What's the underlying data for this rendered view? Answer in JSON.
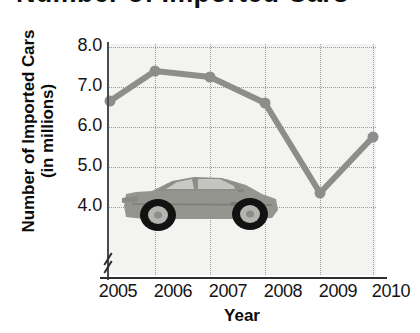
{
  "title": {
    "text": "Number of Imported Cars",
    "truncated": true
  },
  "chart_data": {
    "type": "line",
    "title": "Number of Imported Cars",
    "xlabel": "Year",
    "ylabel": "Number of Imported Cars (in millions)",
    "ylabel_line1": "Number of Imported Cars",
    "ylabel_line2": "(in millions)",
    "categories": [
      "2005",
      "2006",
      "2007",
      "2008",
      "2009",
      "2010"
    ],
    "values": [
      6.65,
      7.4,
      7.25,
      6.6,
      4.35,
      5.75
    ],
    "series": [
      {
        "name": "Imported Cars",
        "values": [
          6.65,
          7.4,
          7.25,
          6.6,
          4.35,
          5.75
        ]
      }
    ],
    "y_ticks": [
      "8.0",
      "7.0",
      "6.0",
      "5.0",
      "4.0"
    ],
    "y_tick_values": [
      8.0,
      7.0,
      6.0,
      5.0,
      4.0
    ],
    "ylim": [
      4.0,
      8.0
    ],
    "axis_break": true,
    "grid": true,
    "grid_style": "dotted",
    "legend": "none",
    "line_color": "#8d8d8b",
    "marker_color": "#8d8d8b",
    "plot_background": "#f3f3f1",
    "decoration": "car-illustration"
  },
  "decoration": {
    "name": "sports-car-illustration",
    "description": "gray sports car side view facing left",
    "body_color": "#9a9a96",
    "tire_color": "#1d1d1d"
  }
}
